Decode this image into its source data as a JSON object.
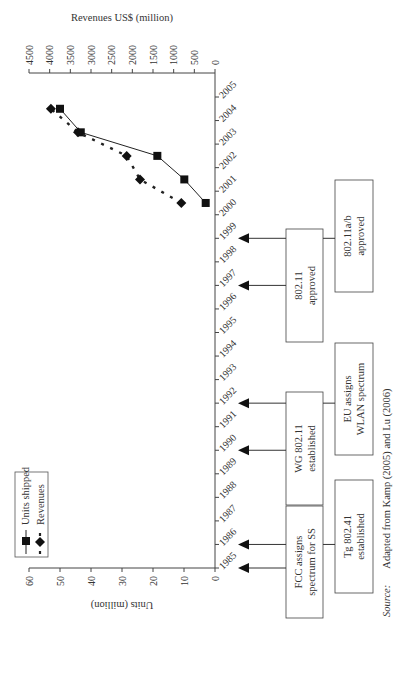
{
  "chart_data": {
    "type": "line",
    "title": "",
    "xlabel": "",
    "ylabel": "Units (million)",
    "y2label": "Revenues US$ (million)",
    "x_categories": [
      "1985",
      "1986",
      "1987",
      "1988",
      "1989",
      "1990",
      "1991",
      "1992",
      "1993",
      "1994",
      "1995",
      "1996",
      "1997",
      "1998",
      "1999",
      "2000",
      "2001",
      "2002",
      "2003",
      "2004",
      "2005"
    ],
    "ylim": [
      0,
      60
    ],
    "y_ticks": [
      0,
      10,
      20,
      30,
      40,
      50,
      60
    ],
    "y2lim": [
      0,
      4500
    ],
    "y2_ticks": [
      0,
      500,
      1000,
      1500,
      2000,
      2500,
      3000,
      3500,
      4000,
      4500
    ],
    "grid": false,
    "legend": {
      "placement": "top-left"
    },
    "series": [
      {
        "name": "Units shipped",
        "axis": "left",
        "style": "solid line, square markers",
        "x": [
          2000.5,
          2001.5,
          2002.5,
          2003.5,
          2004.5
        ],
        "values": [
          3.0,
          9.9,
          18.6,
          43.3,
          50.0
        ]
      },
      {
        "name": "Revenues",
        "axis": "right",
        "style": "dashed line, diamond markers",
        "x": [
          2000.5,
          2001.5,
          2002.5,
          2003.5,
          2004.5
        ],
        "values": [
          815,
          1815,
          2136,
          3315,
          3970
        ]
      }
    ],
    "annotations": [
      {
        "lines": [
          "FCC assigns",
          "spectrum for SS"
        ],
        "years": [
          1985,
          1986
        ],
        "row": "inner"
      },
      {
        "lines": [
          "Tg 802.41",
          "established"
        ],
        "years": [
          1986
        ],
        "row": "outer"
      },
      {
        "lines": [
          "WG 802.11",
          "established"
        ],
        "years": [
          1990,
          1992
        ],
        "row": "inner"
      },
      {
        "lines": [
          "EU assigns",
          "WLAN spectrum"
        ],
        "years": [
          1992
        ],
        "row": "outer"
      },
      {
        "lines": [
          "802.11",
          "approved"
        ],
        "years": [
          1997,
          1999
        ],
        "row": "inner"
      },
      {
        "lines": [
          "802.11a/b",
          "approved"
        ],
        "years": [
          1999
        ],
        "row": "outer"
      }
    ]
  },
  "source": {
    "label": "Source:",
    "text": "Adapted from Kamp (2005) and Lu (2006)"
  }
}
